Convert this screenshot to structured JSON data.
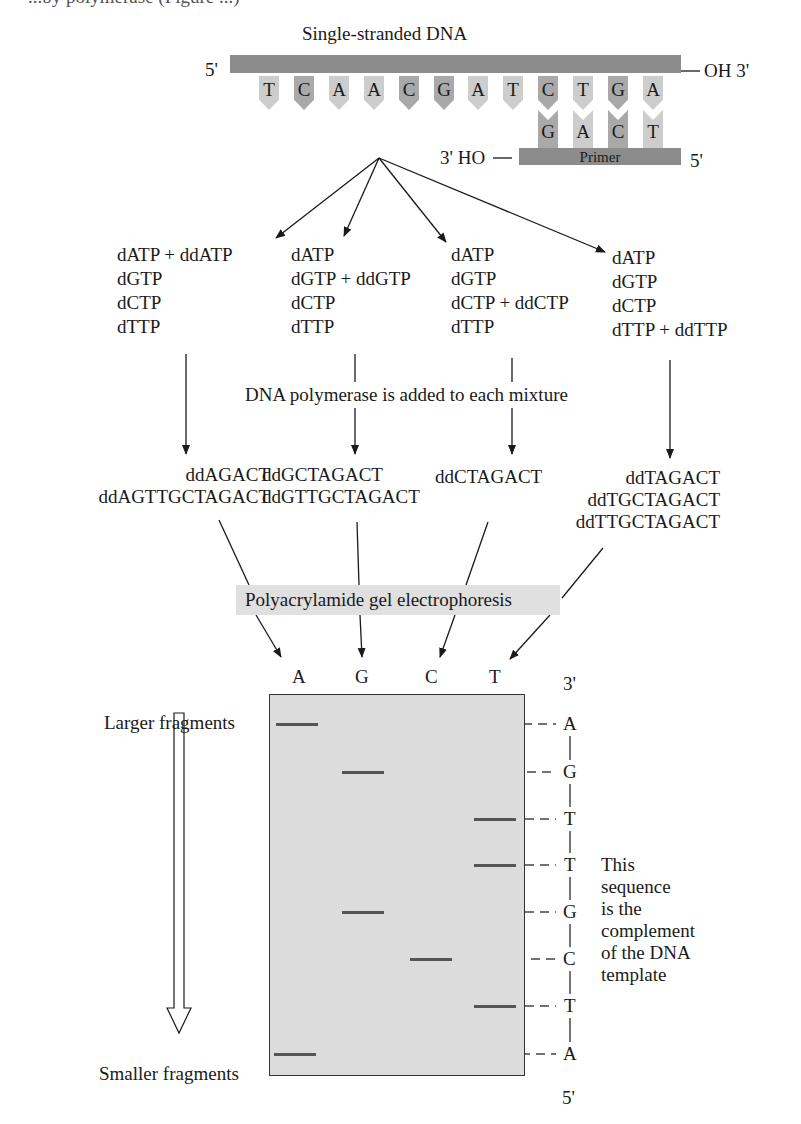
{
  "figure": {
    "cut_top_text": "...by polymerase (Figure ...)",
    "template_strand": {
      "title": "Single-stranded DNA",
      "left_end": "5'",
      "right_end": "OH 3'",
      "bases": [
        "T",
        "C",
        "A",
        "A",
        "C",
        "G",
        "A",
        "T",
        "C",
        "T",
        "G",
        "A"
      ]
    },
    "primer": {
      "label": "Primer",
      "left_end": "3' HO",
      "right_end": "5'",
      "bases": [
        "G",
        "A",
        "C",
        "T"
      ]
    },
    "mixtures": [
      {
        "id": "A",
        "lines": [
          "dATP + ddATP",
          "dGTP",
          "dCTP",
          "dTTP"
        ]
      },
      {
        "id": "G",
        "lines": [
          "dATP",
          "dGTP + ddGTP",
          "dCTP",
          "dTTP"
        ]
      },
      {
        "id": "C",
        "lines": [
          "dATP",
          "dGTP",
          "dCTP + ddCTP",
          "dTTP"
        ]
      },
      {
        "id": "T",
        "lines": [
          "dATP",
          "dGTP",
          "dCTP",
          "dTTP + ddTTP"
        ]
      }
    ],
    "polymerase_step": "DNA polymerase is added to each mixture",
    "products": [
      {
        "lane": "A",
        "fragments": [
          "ddAGACT",
          "ddAGTTGCTAGACT"
        ]
      },
      {
        "lane": "G",
        "fragments": [
          "ddGCTAGACT",
          "ddGTTGCTAGACT"
        ]
      },
      {
        "lane": "C",
        "fragments": [
          "ddCTAGACT"
        ]
      },
      {
        "lane": "T",
        "fragments": [
          "ddTAGACT",
          "ddTGCTAGACT",
          "ddTTGCTAGACT"
        ]
      }
    ],
    "electrophoresis_label": "Polyacrylamide gel electrophoresis",
    "gel": {
      "lanes": [
        "A",
        "G",
        "C",
        "T"
      ],
      "top_end": "3'",
      "bottom_end": "5'",
      "read_sequence": [
        "A",
        "G",
        "T",
        "T",
        "G",
        "C",
        "T",
        "A"
      ],
      "larger_label": "Larger fragments",
      "smaller_label": "Smaller fragments",
      "note_lines": [
        "This",
        "sequence",
        "is the",
        "complement",
        "of the DNA",
        "template"
      ]
    }
  },
  "colors": {
    "backbone": "#8c8c8c",
    "base_light": "#cdcdcd",
    "base_dark": "#a9a9a9",
    "gel_fill": "#dcdcdc",
    "label_box": "#e0e0e0"
  }
}
